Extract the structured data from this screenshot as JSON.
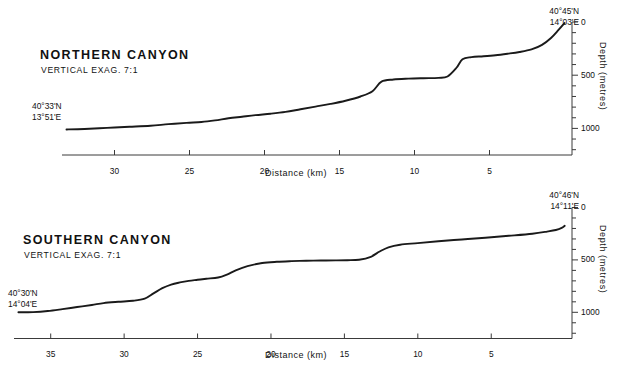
{
  "figure": {
    "background": "#ffffff",
    "line_color": "#1a1a1a",
    "axis_color": "#3a3a3a"
  },
  "chart_data": [
    {
      "type": "line",
      "id": "northern-canyon",
      "title": "NORTHERN  CANYON",
      "subtitle": "VERTICAL EXAG. 7:1",
      "xlabel": "Distance  (km)",
      "ylabel": "Depth   (metres)",
      "xlim": [
        33.5,
        -0.5
      ],
      "ylim": [
        1250,
        0
      ],
      "x_ticks": [
        30,
        25,
        20,
        15,
        10,
        5
      ],
      "x_tick_labels": [
        "30",
        "25",
        "20",
        "15",
        "10",
        "5"
      ],
      "y_ticks": [
        0,
        500,
        1000
      ],
      "y_tick_labels": [
        "0",
        "500",
        "1000"
      ],
      "y_minor_ticks": [
        100,
        200,
        300,
        400,
        600,
        700,
        800,
        900,
        1100,
        1200
      ],
      "grid": false,
      "legend": "none",
      "x_axis_direction": "decreasing",
      "start_label": "40°33'N\n13°51'E",
      "start_label_lines": [
        "40°33'N",
        "13°51'E"
      ],
      "end_label_lines": [
        "40°45'N",
        "14°03'E"
      ],
      "x": [
        33.2,
        32.0,
        30.5,
        29.0,
        27.6,
        26.4,
        25.2,
        24.2,
        23.3,
        22.4,
        21.5,
        20.6,
        19.6,
        18.6,
        17.6,
        16.6,
        15.6,
        14.6,
        13.6,
        12.8,
        12.2,
        11.4,
        10.4,
        9.4,
        8.4,
        7.8,
        7.2,
        6.8,
        6.2,
        5.4,
        4.6,
        3.8,
        3.0,
        2.2,
        1.5,
        0.9,
        0.4,
        0.0
      ],
      "y": [
        1010,
        1005,
        995,
        985,
        975,
        960,
        948,
        940,
        925,
        905,
        890,
        875,
        862,
        845,
        820,
        795,
        770,
        740,
        700,
        650,
        560,
        540,
        532,
        528,
        525,
        512,
        430,
        350,
        330,
        322,
        312,
        298,
        282,
        258,
        215,
        150,
        75,
        10
      ]
    },
    {
      "type": "line",
      "id": "southern-canyon",
      "title": "SOUTHERN  CANYON",
      "subtitle": "VERTICAL EXAG. 7:1",
      "xlabel": "Distance  (km)",
      "ylabel": "Depth   (metres)",
      "xlim": [
        37.5,
        -0.5
      ],
      "ylim": [
        1250,
        0
      ],
      "x_ticks": [
        35,
        30,
        25,
        20,
        15,
        10,
        5
      ],
      "x_tick_labels": [
        "35",
        "30",
        "25",
        "20",
        "15",
        "10",
        "5"
      ],
      "y_ticks": [
        0,
        500,
        1000
      ],
      "y_tick_labels": [
        "0",
        "500",
        "1000"
      ],
      "y_minor_ticks": [
        100,
        200,
        300,
        400,
        600,
        700,
        800,
        900,
        1100,
        1200
      ],
      "grid": false,
      "legend": "none",
      "x_axis_direction": "decreasing",
      "start_label_lines": [
        "40°30'N",
        "14°04'E"
      ],
      "end_label_lines": [
        "40°46'N",
        "14°11'E"
      ],
      "x": [
        37.2,
        36.2,
        35.2,
        34.2,
        33.2,
        32.2,
        31.4,
        30.4,
        29.4,
        28.6,
        28.0,
        27.4,
        26.8,
        26.2,
        25.6,
        25.0,
        24.4,
        23.6,
        23.0,
        22.4,
        21.6,
        20.6,
        19.6,
        18.6,
        17.6,
        16.6,
        15.6,
        14.8,
        14.0,
        13.2,
        12.6,
        12.0,
        11.2,
        10.0,
        8.6,
        7.0,
        5.4,
        3.8,
        2.2,
        1.2,
        0.6,
        0.2,
        0.0
      ],
      "y": [
        1000,
        998,
        988,
        970,
        950,
        930,
        912,
        900,
        890,
        870,
        820,
        770,
        735,
        715,
        700,
        690,
        680,
        668,
        640,
        600,
        560,
        530,
        518,
        512,
        508,
        506,
        505,
        503,
        498,
        470,
        420,
        380,
        355,
        340,
        322,
        305,
        288,
        270,
        250,
        230,
        215,
        195,
        175
      ]
    }
  ]
}
